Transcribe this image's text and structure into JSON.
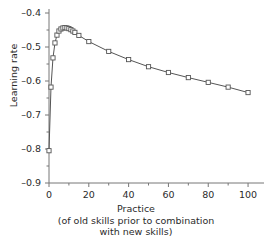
{
  "chart_data": {
    "type": "line",
    "title": "",
    "xlabel": "Practice",
    "xlabel_sub_line1": "(of old skills prior to combination",
    "xlabel_sub_line2": "with new skills)",
    "ylabel": "Learning rate",
    "xlim": [
      0,
      105
    ],
    "ylim": [
      -0.9,
      -0.4
    ],
    "xticks": [
      0,
      20,
      40,
      60,
      80,
      100
    ],
    "xtick_labels": [
      "0",
      "20",
      "40",
      "60",
      "80",
      "100"
    ],
    "x_minor_tick_step": 10,
    "yticks": [
      -0.9,
      -0.8,
      -0.7,
      -0.6,
      -0.5,
      -0.4
    ],
    "ytick_labels": [
      "-0.9",
      "-0.8",
      "-0.7",
      "-0.6",
      "-0.5",
      "-0.4"
    ],
    "y_minor_tick_step": 0.05,
    "grid": false,
    "legend": false,
    "marker": "open-square",
    "line_color": "#555555",
    "marker_edge_color": "#555555",
    "marker_face_color": "#ffffff",
    "axis_color": "#777777",
    "series": [
      {
        "name": "Learning rate",
        "x": [
          0,
          1,
          2,
          3,
          4,
          5,
          6,
          7,
          8,
          9,
          10,
          11,
          12,
          13,
          15,
          20,
          30,
          40,
          50,
          60,
          70,
          80,
          90,
          100
        ],
        "values": [
          -0.805,
          -0.618,
          -0.532,
          -0.488,
          -0.465,
          -0.453,
          -0.447,
          -0.444,
          -0.443,
          -0.444,
          -0.446,
          -0.449,
          -0.453,
          -0.457,
          -0.466,
          -0.484,
          -0.513,
          -0.537,
          -0.558,
          -0.575,
          -0.59,
          -0.604,
          -0.618,
          -0.634
        ]
      }
    ]
  }
}
